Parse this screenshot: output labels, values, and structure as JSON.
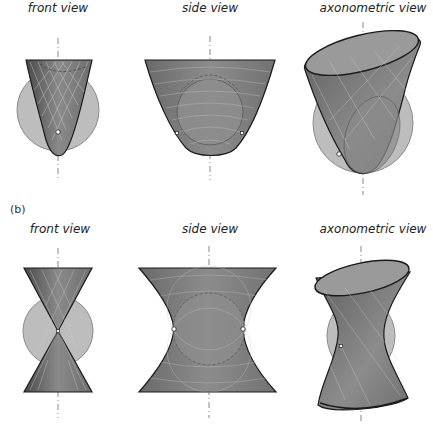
{
  "row_a": {
    "views": [
      {
        "title": "front view",
        "shape": "paraboloid"
      },
      {
        "title": "side view",
        "shape": "paraboloid"
      },
      {
        "title": "axonometric view",
        "shape": "paraboloid"
      }
    ]
  },
  "row_b": {
    "label": "(b)",
    "views": [
      {
        "title": "front view",
        "shape": "hyperboloid"
      },
      {
        "title": "side view",
        "shape": "hyperboloid"
      },
      {
        "title": "axonometric view",
        "shape": "hyperboloid"
      }
    ]
  },
  "colors": {
    "surface": "#7a7a7a",
    "surface_dark": "#555555",
    "sphere": "#bdbdbd",
    "outline": "#1a1a1a",
    "ruling_lines": "#d8d8d8",
    "axis": "#888888"
  }
}
